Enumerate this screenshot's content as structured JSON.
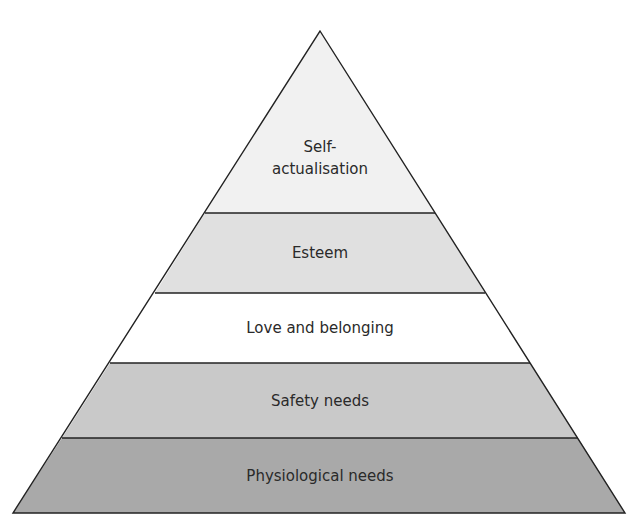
{
  "diagram": {
    "type": "pyramid",
    "title_fragment": "",
    "levels": [
      {
        "label_line1": "Self-",
        "label_line2": "actualisation",
        "fill": "#f1f1f1"
      },
      {
        "label": "Esteem",
        "fill": "#e0e0e0"
      },
      {
        "label": "Love and belonging",
        "fill": "#ffffff"
      },
      {
        "label": "Safety needs",
        "fill": "#c9c9c9"
      },
      {
        "label": "Physiological needs",
        "fill": "#a9a9a9"
      }
    ]
  }
}
